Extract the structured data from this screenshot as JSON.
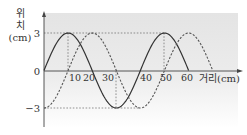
{
  "chart_data": {
    "type": "line",
    "title": "",
    "xlabel": "거리(cm)",
    "ylabel_lines": [
      "위",
      "치",
      "(cm)"
    ],
    "x_ticks": [
      "10",
      "20",
      "30",
      "40",
      "50",
      "60"
    ],
    "y_ticks": [
      "3",
      "0",
      "-3"
    ],
    "origin_label": "0",
    "xlim": [
      0,
      80
    ],
    "ylim": [
      -3,
      3
    ],
    "grid": false,
    "series": [
      {
        "name": "solid wave",
        "style": "solid",
        "function": "3*sin(2*pi*x/40)",
        "x": [
          0,
          10,
          20,
          30,
          40,
          50,
          60
        ],
        "values": [
          0,
          3,
          0,
          -3,
          0,
          3,
          0
        ]
      },
      {
        "name": "dashed wave",
        "style": "dashed",
        "function": "-3*cos(2*pi*x/40)",
        "x": [
          0,
          10,
          20,
          30,
          40,
          50,
          60,
          70
        ],
        "values": [
          -3,
          0,
          3,
          0,
          -3,
          0,
          3,
          0
        ]
      }
    ],
    "amplitude": 3,
    "wavelength": 40
  },
  "labels": {
    "y1": "위",
    "y2": "치",
    "y3": "(cm)",
    "ytick_pos": "3",
    "ytick_zero": "0",
    "ytick_neg": "−3",
    "xt10": "10",
    "xt20": "20",
    "xt30": "30",
    "xt40": "40",
    "xt50": "50",
    "xt60": "60",
    "xlabel": "거리(cm)"
  }
}
